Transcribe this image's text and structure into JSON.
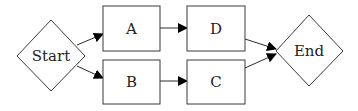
{
  "diagram": {
    "type": "flowchart",
    "nodes": [
      {
        "id": "start",
        "label": "Start",
        "shape": "diamond"
      },
      {
        "id": "a",
        "label": "A",
        "shape": "rectangle"
      },
      {
        "id": "b",
        "label": "B",
        "shape": "rectangle"
      },
      {
        "id": "d",
        "label": "D",
        "shape": "rectangle"
      },
      {
        "id": "c",
        "label": "C",
        "shape": "rectangle"
      },
      {
        "id": "end",
        "label": "End",
        "shape": "diamond"
      }
    ],
    "edges": [
      {
        "from": "Start",
        "to": "A"
      },
      {
        "from": "Start",
        "to": "B"
      },
      {
        "from": "A",
        "to": "D"
      },
      {
        "from": "B",
        "to": "C"
      },
      {
        "from": "D",
        "to": "End"
      },
      {
        "from": "C",
        "to": "End"
      }
    ]
  },
  "colors": {
    "stroke": "#3a3a3a",
    "arrow": "#000000",
    "background": "#ffffff"
  }
}
